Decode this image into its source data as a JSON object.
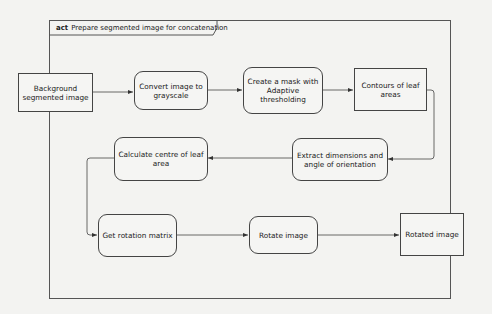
{
  "diagram": {
    "type": "UML activity diagram",
    "frame": {
      "keyword": "act",
      "title": "Prepare segmented image for concatenation"
    },
    "nodes": [
      {
        "id": "n1",
        "kind": "object",
        "label": "Background segmented image"
      },
      {
        "id": "n2",
        "kind": "action",
        "label": "Convert image to grayscale"
      },
      {
        "id": "n3",
        "kind": "action",
        "label": "Create a mask with Adaptive thresholding"
      },
      {
        "id": "n4",
        "kind": "object",
        "label": "Contours of leaf areas"
      },
      {
        "id": "n5",
        "kind": "action",
        "label": "Extract dimensions and angle of orientation"
      },
      {
        "id": "n6",
        "kind": "action",
        "label": "Calculate centre of leaf area"
      },
      {
        "id": "n7",
        "kind": "action",
        "label": "Get rotation matrix"
      },
      {
        "id": "n8",
        "kind": "action",
        "label": "Rotate image"
      },
      {
        "id": "n9",
        "kind": "object",
        "label": "Rotated image"
      }
    ],
    "edges": [
      {
        "from": "n1",
        "to": "n2"
      },
      {
        "from": "n2",
        "to": "n3"
      },
      {
        "from": "n3",
        "to": "n4"
      },
      {
        "from": "n4",
        "to": "n5"
      },
      {
        "from": "n5",
        "to": "n6"
      },
      {
        "from": "n6",
        "to": "n7"
      },
      {
        "from": "n7",
        "to": "n8"
      },
      {
        "from": "n8",
        "to": "n9"
      }
    ],
    "colors": {
      "line": "#444444",
      "background": "#f3f3f1",
      "text": "#222222"
    }
  }
}
